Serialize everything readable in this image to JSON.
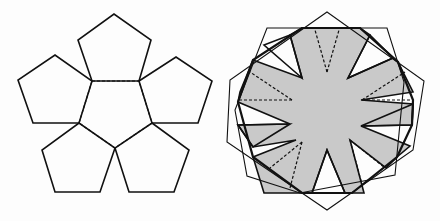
{
  "colors": {
    "line": "#111111",
    "shade": "#c9c9c9",
    "background": "#fdfdfd"
  },
  "left_figure": {
    "description": "net of six pentagons: central dashed pentagon with five solid pentagons attached",
    "center_dashed": [
      [
        92,
        81
      ],
      [
        139,
        81
      ],
      [
        152,
        123
      ],
      [
        115,
        148
      ],
      [
        79,
        123
      ]
    ],
    "petals": [
      [
        [
          92,
          81
        ],
        [
          78,
          40
        ],
        [
          114,
          14
        ],
        [
          151,
          40
        ],
        [
          139,
          81
        ]
      ],
      [
        [
          139,
          81
        ],
        [
          176,
          57
        ],
        [
          212,
          81
        ],
        [
          198,
          123
        ],
        [
          152,
          123
        ]
      ],
      [
        [
          152,
          123
        ],
        [
          189,
          150
        ],
        [
          174,
          192
        ],
        [
          129,
          192
        ],
        [
          115,
          148
        ]
      ],
      [
        [
          115,
          148
        ],
        [
          100,
          192
        ],
        [
          55,
          192
        ],
        [
          42,
          150
        ],
        [
          79,
          123
        ]
      ],
      [
        [
          79,
          123
        ],
        [
          33,
          123
        ],
        [
          18,
          80
        ],
        [
          55,
          55
        ],
        [
          92,
          81
        ]
      ]
    ]
  },
  "right_figure": {
    "description": "shaded eight-armed star with dashed fold lines, overlaid by a bold octagon and two thin rotated polygons",
    "star": [
      [
        290,
        35
      ],
      [
        302,
        28
      ],
      [
        360,
        28
      ],
      [
        370,
        35
      ],
      [
        348,
        78
      ],
      [
        393,
        58
      ],
      [
        398,
        62
      ],
      [
        413,
        92
      ],
      [
        361,
        100
      ],
      [
        413,
        104
      ],
      [
        412,
        125
      ],
      [
        361,
        126
      ],
      [
        410,
        146
      ],
      [
        397,
        157
      ],
      [
        386,
        168
      ],
      [
        350,
        140
      ],
      [
        364,
        193
      ],
      [
        345,
        193
      ],
      [
        327,
        150
      ],
      [
        312,
        193
      ],
      [
        264,
        193
      ],
      [
        253,
        157
      ],
      [
        296,
        140
      ],
      [
        253,
        147
      ],
      [
        238,
        125
      ],
      [
        290,
        124
      ],
      [
        238,
        102
      ],
      [
        240,
        92
      ],
      [
        253,
        60
      ],
      [
        302,
        78
      ],
      [
        290,
        35
      ]
    ],
    "bold_octagon": [
      [
        302,
        28
      ],
      [
        360,
        28
      ],
      [
        398,
        62
      ],
      [
        413,
        100
      ],
      [
        412,
        125
      ],
      [
        397,
        157
      ],
      [
        352,
        193
      ],
      [
        302,
        193
      ],
      [
        253,
        157
      ],
      [
        238,
        102
      ],
      [
        253,
        60
      ]
    ],
    "thin_polygon_a": [
      [
        327,
        12
      ],
      [
        424,
        81
      ],
      [
        413,
        150
      ],
      [
        327,
        210
      ],
      [
        227,
        142
      ],
      [
        230,
        80
      ]
    ],
    "thin_polygon_b": [
      [
        267,
        28
      ],
      [
        387,
        28
      ],
      [
        404,
        82
      ],
      [
        395,
        175
      ],
      [
        300,
        193
      ],
      [
        247,
        176
      ],
      [
        235,
        110
      ]
    ],
    "notches": [
      [
        [
          290,
          35
        ],
        [
          302,
          78
        ],
        [
          264,
          45
        ]
      ],
      [
        [
          370,
          35
        ],
        [
          348,
          78
        ],
        [
          393,
          58
        ]
      ],
      [
        [
          238,
          125
        ],
        [
          290,
          124
        ],
        [
          253,
          147
        ]
      ],
      [
        [
          413,
          104
        ],
        [
          361,
          126
        ],
        [
          412,
          125
        ]
      ],
      [
        [
          327,
          150
        ],
        [
          312,
          193
        ],
        [
          345,
          193
        ]
      ]
    ],
    "dashed_folds": [
      [
        [
          327,
          72
        ],
        [
          315,
          30
        ]
      ],
      [
        [
          327,
          72
        ],
        [
          339,
          30
        ]
      ],
      [
        [
          292,
          100
        ],
        [
          240,
          100
        ]
      ],
      [
        [
          292,
          100
        ],
        [
          250,
          72
        ]
      ],
      [
        [
          362,
          100
        ],
        [
          413,
          100
        ]
      ],
      [
        [
          362,
          100
        ],
        [
          405,
          72
        ]
      ],
      [
        [
          302,
          142
        ],
        [
          270,
          168
        ]
      ],
      [
        [
          302,
          142
        ],
        [
          290,
          188
        ]
      ],
      [
        [
          350,
          140
        ],
        [
          385,
          168
        ]
      ],
      [
        [
          350,
          140
        ],
        [
          363,
          188
        ]
      ]
    ]
  }
}
